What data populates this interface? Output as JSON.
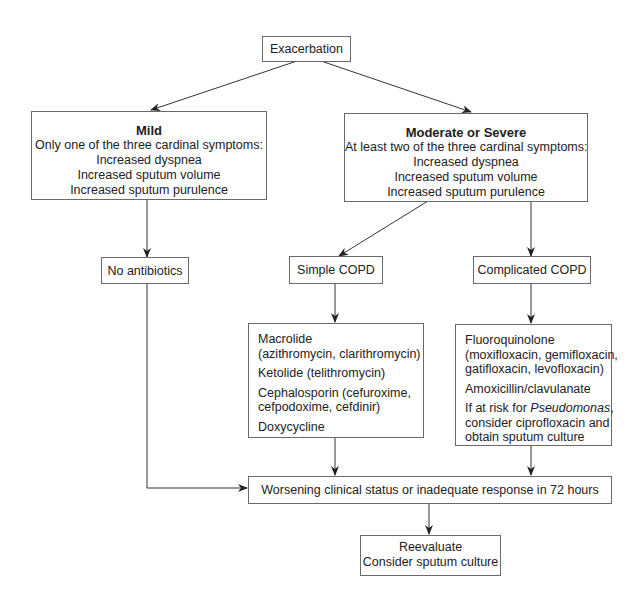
{
  "diagram": {
    "start": {
      "label": "Exacerbation"
    },
    "mild": {
      "title": "Mild",
      "subtitle": "Only one of the three cardinal symptoms:",
      "symptoms": [
        "Increased dyspnea",
        "Increased sputum volume",
        "Increased sputum purulence"
      ]
    },
    "moderate": {
      "title": "Moderate or Severe",
      "subtitle": "At least two of the three cardinal symptoms:",
      "symptoms": [
        "Increased dyspnea",
        "Increased sputum volume",
        "Increased sputum purulence"
      ]
    },
    "no_antibiotics": {
      "label": "No antibiotics"
    },
    "simple": {
      "label": "Simple COPD"
    },
    "complicated": {
      "label": "Complicated COPD"
    },
    "simple_drugs": [
      [
        "Macrolide",
        "(azithromycin, clarithromycin)"
      ],
      [
        "Ketolide (telithromycin)"
      ],
      [
        "Cephalosporin (cefuroxime,",
        "cefpodoxime, cefdinir)"
      ],
      [
        "Doxycycline"
      ]
    ],
    "complicated_drugs": {
      "fluoroquinolone": [
        "Fluoroquinolone",
        "(moxifloxacin, gemifloxacin,",
        "gatifloxacin, levofloxacin)"
      ],
      "amoxicillin": "Amoxicillin/clavulanate",
      "pseudomonas_prefix": "If at risk for ",
      "pseudomonas_italic": "Pseudomonas",
      "pseudomonas_suffix": ",",
      "pseudomonas_rest": [
        "consider ciprofloxacin and",
        "obtain sputum culture"
      ]
    },
    "worsening": {
      "label": "Worsening clinical status or inadequate response in 72 hours"
    },
    "reevaluate": {
      "lines": [
        "Reevaluate",
        "Consider sputum culture"
      ]
    },
    "colors": {
      "line": "#333333",
      "border": "#6a6a6a",
      "text": "#222222"
    }
  }
}
